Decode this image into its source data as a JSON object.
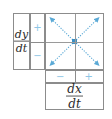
{
  "figure": {
    "kind": "phase-plane-sign-table",
    "axis_labels": {
      "vertical": {
        "numerator": "dy",
        "denominator": "dt"
      },
      "horizontal": {
        "numerator": "dx",
        "denominator": "dt"
      }
    },
    "vertical_signs": {
      "top": "+",
      "bottom": "−"
    },
    "horizontal_signs": {
      "left": "−",
      "right": "+"
    },
    "equilibrium": {
      "label": "center-node",
      "color": "#3a8fc4"
    },
    "arrows": [
      {
        "name": "arrow-up-left",
        "direction": "up-left",
        "color": "#5aa9d6"
      },
      {
        "name": "arrow-up-right",
        "direction": "up-right",
        "color": "#5aa9d6"
      },
      {
        "name": "arrow-down-left",
        "direction": "down-left",
        "color": "#5aa9d6"
      },
      {
        "name": "arrow-down-right",
        "direction": "down-right",
        "color": "#5aa9d6"
      }
    ],
    "colors": {
      "border": "#8c8c8c",
      "gridline": "#9a9a9a",
      "sign": "#8ec6e6",
      "arrow": "#5aa9d6",
      "node": "#3a8fc4",
      "text": "#2b2b2b",
      "background": "#ffffff"
    }
  }
}
